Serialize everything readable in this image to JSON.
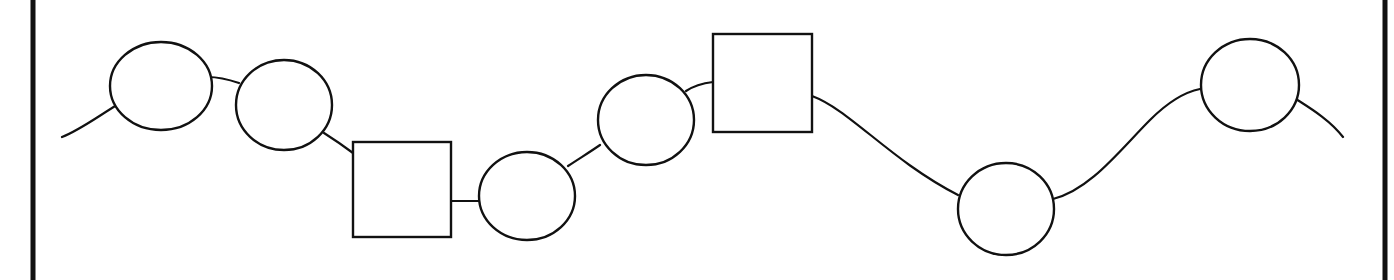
{
  "diagram": {
    "title": "",
    "stroke_color": "#111111",
    "background": "#ffffff",
    "border": {
      "left_x": 33,
      "right_x": 1385,
      "width": 5
    },
    "chain_path": "M62,137 C80,130 100,115 117,105 M208,77 C220,77 230,80 239,83 M324,133 C335,140 345,147 353,153 M452,201 L481,201 M568,166 C580,158 590,152 600,145 M686,91 C695,85 705,83 713,82 M812,96 C850,110 890,160 958,195 M1053,199 C1090,190 1120,150 1150,120 C1170,100 1185,92 1200,89 M1296,99 C1310,108 1330,120 1343,137",
    "nodes": [
      {
        "shape": "circle",
        "cx": 161,
        "cy": 86,
        "rx": 51,
        "ry": 44
      },
      {
        "shape": "circle",
        "cx": 284,
        "cy": 105,
        "rx": 48,
        "ry": 45
      },
      {
        "shape": "square",
        "x": 353,
        "y": 142,
        "w": 98,
        "h": 95
      },
      {
        "shape": "circle",
        "cx": 527,
        "cy": 196,
        "rx": 48,
        "ry": 44
      },
      {
        "shape": "circle",
        "cx": 646,
        "cy": 120,
        "rx": 48,
        "ry": 45
      },
      {
        "shape": "square",
        "x": 713,
        "y": 34,
        "w": 99,
        "h": 98
      },
      {
        "shape": "circle",
        "cx": 1006,
        "cy": 209,
        "rx": 48,
        "ry": 46
      },
      {
        "shape": "circle",
        "cx": 1250,
        "cy": 85,
        "rx": 49,
        "ry": 46
      }
    ]
  }
}
